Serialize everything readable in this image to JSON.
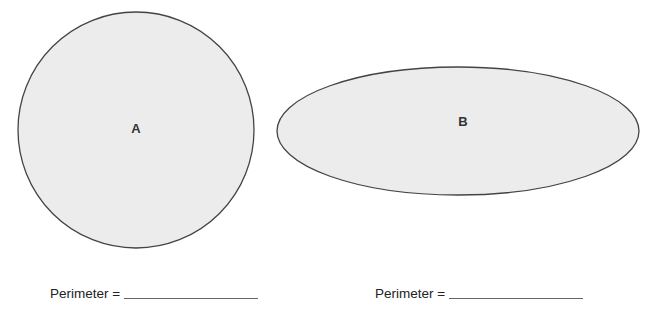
{
  "shapes": {
    "a": {
      "label": "A",
      "type": "circle",
      "cx": 136,
      "cy": 130,
      "r": 118,
      "fill": "#ececec",
      "stroke": "#444444"
    },
    "b": {
      "label": "B",
      "type": "ellipse",
      "cx": 458,
      "cy": 131,
      "rx": 181,
      "ry": 64,
      "fill": "#ececec",
      "stroke": "#444444"
    }
  },
  "answers": {
    "a": {
      "label": "Perimeter ="
    },
    "b": {
      "label": "Perimeter ="
    }
  }
}
